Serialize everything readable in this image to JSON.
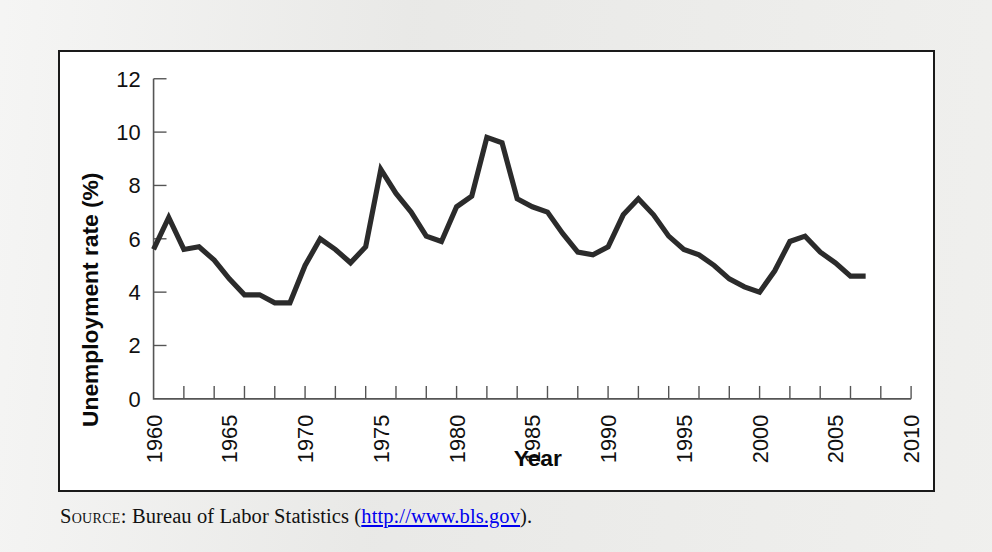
{
  "page": {
    "background_color": "#e9e9e7",
    "figure_box_background": "#ffffff",
    "figure_border_color": "#1a1a1a"
  },
  "source": {
    "label": "Source:",
    "text_before_url": "Bureau of Labor Statistics (",
    "url": "http://www.bls.gov",
    "text_after_url": ")."
  },
  "chart_data": {
    "type": "line",
    "title": "",
    "xlabel": "Year",
    "ylabel": "Unemployment rate (%)",
    "xlim": [
      1960,
      2010
    ],
    "ylim": [
      0,
      12
    ],
    "grid": false,
    "legend": "none",
    "line_color": "#2b2b2b",
    "xticks": [
      1960,
      1962,
      1964,
      1966,
      1968,
      1970,
      1972,
      1974,
      1976,
      1978,
      1980,
      1982,
      1984,
      1986,
      1988,
      1990,
      1992,
      1994,
      1996,
      1998,
      2000,
      2002,
      2004,
      2006,
      2008,
      2010
    ],
    "xtick_labels": [
      "1960",
      "1965",
      "1970",
      "1975",
      "1980",
      "1985",
      "1990",
      "1995",
      "2000",
      "2005",
      "2010"
    ],
    "xtick_label_values": [
      1960,
      1965,
      1970,
      1975,
      1980,
      1985,
      1990,
      1995,
      2000,
      2005,
      2010
    ],
    "yticks": [
      0,
      2,
      4,
      6,
      8,
      10,
      12
    ],
    "ytick_labels": [
      "0",
      "2",
      "4",
      "6",
      "8",
      "10",
      "12"
    ],
    "x": [
      1960,
      1961,
      1962,
      1963,
      1964,
      1965,
      1966,
      1967,
      1968,
      1969,
      1970,
      1971,
      1972,
      1973,
      1974,
      1975,
      1976,
      1977,
      1978,
      1979,
      1980,
      1981,
      1982,
      1983,
      1984,
      1985,
      1986,
      1987,
      1988,
      1989,
      1990,
      1991,
      1992,
      1993,
      1994,
      1995,
      1996,
      1997,
      1998,
      1999,
      2000,
      2001,
      2002,
      2003,
      2004,
      2005,
      2006,
      2007
    ],
    "values": [
      5.6,
      6.8,
      5.6,
      5.7,
      5.2,
      4.5,
      3.9,
      3.9,
      3.6,
      3.6,
      5.0,
      6.0,
      5.6,
      5.1,
      5.7,
      8.6,
      7.7,
      7.0,
      6.1,
      5.9,
      7.2,
      7.6,
      9.8,
      9.6,
      7.5,
      7.2,
      7.0,
      6.2,
      5.5,
      5.4,
      5.7,
      6.9,
      7.5,
      6.9,
      6.1,
      5.6,
      5.4,
      5.0,
      4.5,
      4.2,
      4.0,
      4.8,
      5.9,
      6.1,
      5.5,
      5.1,
      4.6,
      4.6
    ],
    "series": [
      {
        "name": "Unemployment rate",
        "values": [
          5.6,
          6.8,
          5.6,
          5.7,
          5.2,
          4.5,
          3.9,
          3.9,
          3.6,
          3.6,
          5.0,
          6.0,
          5.6,
          5.1,
          5.7,
          8.6,
          7.7,
          7.0,
          6.1,
          5.9,
          7.2,
          7.6,
          9.8,
          9.6,
          7.5,
          7.2,
          7.0,
          6.2,
          5.5,
          5.4,
          5.7,
          6.9,
          7.5,
          6.9,
          6.1,
          5.6,
          5.4,
          5.0,
          4.5,
          4.2,
          4.0,
          4.8,
          5.9,
          6.1,
          5.5,
          5.1,
          4.6,
          4.6
        ]
      }
    ]
  }
}
